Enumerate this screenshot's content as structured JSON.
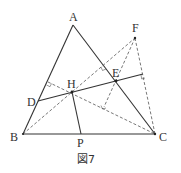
{
  "figure": {
    "caption": "図7",
    "points": {
      "A": {
        "label": "A",
        "x": 73,
        "y": 25
      },
      "B": {
        "label": "B",
        "x": 23,
        "y": 134
      },
      "C": {
        "label": "C",
        "x": 155,
        "y": 134
      },
      "D": {
        "label": "D",
        "x": 38,
        "y": 101
      },
      "E": {
        "label": "E",
        "x": 116,
        "y": 81
      },
      "F": {
        "label": "F",
        "x": 135,
        "y": 38
      },
      "H": {
        "label": "H",
        "x": 72,
        "y": 92
      },
      "P": {
        "label": "P",
        "x": 81,
        "y": 134
      }
    },
    "solid_segments": [
      [
        "A",
        "B"
      ],
      [
        "B",
        "C"
      ],
      [
        "C",
        "A"
      ],
      [
        "D",
        "E"
      ],
      [
        "H",
        "P"
      ]
    ],
    "dashed_segments": [
      [
        "B",
        "F"
      ],
      [
        "F",
        "C"
      ],
      [
        "H",
        "C"
      ],
      [
        "E",
        "F"
      ],
      [
        "B",
        "H"
      ],
      [
        "H",
        "F"
      ]
    ]
  }
}
